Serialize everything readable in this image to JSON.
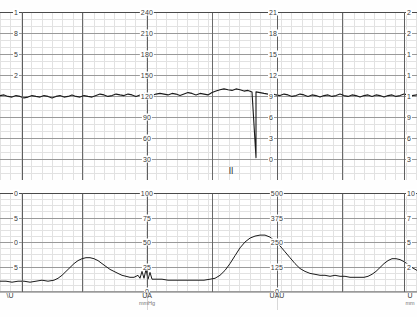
{
  "document": {
    "title": "Cardiotocography Trace Strip",
    "type": "ctg-paper-chart"
  },
  "colors": {
    "trace": "#1b1b1b",
    "grid_minor": "#e2e2e2",
    "grid_major": "#8d8d8d",
    "grid_heavy": "#6a6a6a",
    "paper": "#ffffff",
    "label": "#3a3a3a"
  },
  "fhr_panel": {
    "name": "fetal-heart-rate-panel",
    "scales": [
      {
        "id": "fhr-left-clipped",
        "x": 22,
        "align": "left",
        "clipped": true,
        "ticks": [
          "1",
          "8",
          "5",
          "2",
          "",
          "",
          "",
          ""
        ]
      },
      {
        "id": "fhr-bpm-center",
        "x": 147,
        "align": "center",
        "unit": "bpm",
        "ticks": [
          "240",
          "210",
          "180",
          "150",
          "120",
          "90",
          "60",
          "30"
        ]
      },
      {
        "id": "fhr-kpa-right",
        "x": 277,
        "align": "left",
        "ticks": [
          "21",
          "18",
          "15",
          "12",
          "9",
          "6",
          "3",
          "0"
        ]
      },
      {
        "id": "fhr-right-clipped",
        "x": 404,
        "align": "left",
        "clipped": true,
        "ticks": [
          "2",
          "2",
          "1",
          "1",
          "1",
          "9",
          "6",
          "3"
        ]
      }
    ]
  },
  "toco_panel": {
    "name": "uterine-activity-panel",
    "scales": [
      {
        "id": "toco-left-clipped",
        "x": 22,
        "align": "left",
        "clipped": true,
        "ticks": [
          "0",
          "5",
          "0",
          "5",
          ""
        ]
      },
      {
        "id": "toco-mmhg-center",
        "x": 147,
        "align": "center",
        "unit": "mmHg",
        "ticks": [
          "100",
          "75",
          "50",
          "25",
          "0"
        ]
      },
      {
        "id": "toco-uau-right",
        "x": 277,
        "align": "center",
        "unit": "UAU",
        "ticks": [
          "500",
          "375",
          "250",
          "125",
          "0"
        ]
      },
      {
        "id": "toco-right-clipped",
        "x": 404,
        "align": "left",
        "clipped": true,
        "ticks": [
          "10",
          "7",
          "5",
          "2",
          ""
        ]
      }
    ]
  },
  "footer": {
    "name": "axis-footer",
    "labels": [
      {
        "x": 10,
        "text": "\\U",
        "unit": ""
      },
      {
        "x": 147,
        "text": "UA",
        "unit": "mmHg"
      },
      {
        "x": 277,
        "text": "UAU",
        "unit": ""
      },
      {
        "x": 410,
        "text": "U",
        "unit": "mm"
      }
    ]
  },
  "markers": [
    {
      "name": "event-marker",
      "x": 231,
      "y": 171,
      "glyph": "ӀӀ"
    }
  ],
  "chart_data": [
    {
      "type": "line",
      "name": "fhr-trace",
      "title": "Fetal Heart Rate",
      "ylabel": "bpm",
      "ylim": [
        30,
        255
      ],
      "yticks": [
        30,
        60,
        90,
        120,
        150,
        180,
        210,
        240
      ],
      "grid": true,
      "xlabel": "time",
      "baseline": 145,
      "points": [
        [
          0,
          143
        ],
        [
          4,
          144
        ],
        [
          8,
          142
        ],
        [
          12,
          141
        ],
        [
          16,
          143
        ],
        [
          20,
          142
        ],
        [
          24,
          140
        ],
        [
          28,
          141
        ],
        [
          32,
          143
        ],
        [
          36,
          142
        ],
        [
          40,
          141
        ],
        [
          44,
          143
        ],
        [
          48,
          142
        ],
        [
          52,
          140
        ],
        [
          56,
          142
        ],
        [
          60,
          143
        ],
        [
          64,
          141
        ],
        [
          68,
          142
        ],
        [
          72,
          144
        ],
        [
          76,
          142
        ],
        [
          80,
          141
        ],
        [
          84,
          143
        ],
        [
          88,
          142
        ],
        [
          92,
          141
        ],
        [
          96,
          143
        ],
        [
          100,
          145
        ],
        [
          104,
          144
        ],
        [
          108,
          142
        ],
        [
          112,
          143
        ],
        [
          116,
          145
        ],
        [
          120,
          144
        ],
        [
          124,
          143
        ],
        [
          128,
          145
        ],
        [
          132,
          144
        ],
        [
          136,
          142
        ],
        [
          140,
          144
        ],
        [
          144,
          146
        ],
        [
          148,
          145
        ],
        [
          152,
          143
        ],
        [
          156,
          145
        ],
        [
          160,
          146
        ],
        [
          164,
          145
        ],
        [
          168,
          144
        ],
        [
          172,
          146
        ],
        [
          176,
          145
        ],
        [
          180,
          143
        ],
        [
          184,
          145
        ],
        [
          188,
          147
        ],
        [
          192,
          146
        ],
        [
          196,
          144
        ],
        [
          200,
          146
        ],
        [
          204,
          145
        ],
        [
          208,
          144
        ],
        [
          212,
          147
        ],
        [
          216,
          149
        ],
        [
          220,
          151
        ],
        [
          224,
          152
        ],
        [
          228,
          151
        ],
        [
          232,
          150
        ],
        [
          236,
          152
        ],
        [
          240,
          151
        ],
        [
          244,
          149
        ],
        [
          248,
          150
        ],
        [
          252,
          148
        ],
        [
          256,
          60
        ],
        [
          256,
          148
        ],
        [
          260,
          147
        ],
        [
          264,
          146
        ],
        [
          268,
          145
        ],
        [
          272,
          146
        ],
        [
          276,
          144
        ],
        [
          280,
          143
        ],
        [
          284,
          145
        ],
        [
          288,
          144
        ],
        [
          292,
          142
        ],
        [
          296,
          143
        ],
        [
          300,
          145
        ],
        [
          304,
          144
        ],
        [
          308,
          142
        ],
        [
          312,
          144
        ],
        [
          316,
          143
        ],
        [
          320,
          141
        ],
        [
          324,
          143
        ],
        [
          328,
          144
        ],
        [
          332,
          142
        ],
        [
          336,
          143
        ],
        [
          340,
          145
        ],
        [
          344,
          143
        ],
        [
          348,
          142
        ],
        [
          352,
          144
        ],
        [
          356,
          143
        ],
        [
          360,
          141
        ],
        [
          364,
          143
        ],
        [
          368,
          144
        ],
        [
          372,
          142
        ],
        [
          376,
          144
        ],
        [
          380,
          143
        ],
        [
          384,
          141
        ],
        [
          388,
          143
        ],
        [
          392,
          144
        ],
        [
          396,
          142
        ],
        [
          400,
          143
        ],
        [
          404,
          145
        ],
        [
          408,
          144
        ],
        [
          412,
          143
        ],
        [
          417,
          144
        ]
      ]
    },
    {
      "type": "line",
      "name": "toco-trace",
      "title": "Uterine Activity (TOCO)",
      "ylabel": "mmHg",
      "ylim": [
        0,
        100
      ],
      "yticks": [
        0,
        25,
        50,
        75,
        100
      ],
      "grid": true,
      "xlabel": "time",
      "baseline": 10,
      "contractions": [
        {
          "peak_x": 88,
          "peak_value": 34,
          "onset_x": 55,
          "offset_x": 125
        },
        {
          "peak_x": 262,
          "peak_value": 57,
          "onset_x": 215,
          "offset_x": 300
        },
        {
          "peak_x": 396,
          "peak_value": 33,
          "onset_x": 368,
          "offset_x": 417
        }
      ],
      "points": [
        [
          0,
          10
        ],
        [
          6,
          10
        ],
        [
          12,
          9
        ],
        [
          18,
          10
        ],
        [
          24,
          10
        ],
        [
          30,
          9
        ],
        [
          36,
          10
        ],
        [
          42,
          11
        ],
        [
          48,
          10
        ],
        [
          54,
          11
        ],
        [
          58,
          13
        ],
        [
          62,
          16
        ],
        [
          66,
          20
        ],
        [
          70,
          24
        ],
        [
          74,
          28
        ],
        [
          78,
          31
        ],
        [
          82,
          33
        ],
        [
          86,
          34
        ],
        [
          90,
          34
        ],
        [
          94,
          33
        ],
        [
          98,
          31
        ],
        [
          102,
          28
        ],
        [
          106,
          25
        ],
        [
          110,
          22
        ],
        [
          114,
          20
        ],
        [
          118,
          18
        ],
        [
          122,
          16
        ],
        [
          126,
          15
        ],
        [
          130,
          14
        ],
        [
          134,
          14
        ],
        [
          138,
          16
        ],
        [
          140,
          13
        ],
        [
          142,
          20
        ],
        [
          144,
          13
        ],
        [
          146,
          22
        ],
        [
          148,
          12
        ],
        [
          150,
          19
        ],
        [
          152,
          12
        ],
        [
          156,
          12
        ],
        [
          162,
          12
        ],
        [
          168,
          11
        ],
        [
          174,
          11
        ],
        [
          180,
          11
        ],
        [
          186,
          11
        ],
        [
          192,
          11
        ],
        [
          198,
          11
        ],
        [
          204,
          11
        ],
        [
          210,
          12
        ],
        [
          215,
          13
        ],
        [
          220,
          16
        ],
        [
          225,
          21
        ],
        [
          230,
          28
        ],
        [
          235,
          36
        ],
        [
          240,
          44
        ],
        [
          245,
          50
        ],
        [
          250,
          54
        ],
        [
          255,
          56
        ],
        [
          260,
          57
        ],
        [
          265,
          57
        ],
        [
          270,
          55
        ],
        [
          275,
          51
        ],
        [
          280,
          46
        ],
        [
          285,
          40
        ],
        [
          290,
          34
        ],
        [
          295,
          28
        ],
        [
          300,
          23
        ],
        [
          305,
          20
        ],
        [
          310,
          18
        ],
        [
          315,
          17
        ],
        [
          320,
          16
        ],
        [
          325,
          16
        ],
        [
          330,
          15
        ],
        [
          335,
          16
        ],
        [
          340,
          15
        ],
        [
          345,
          15
        ],
        [
          350,
          14
        ],
        [
          355,
          14
        ],
        [
          360,
          14
        ],
        [
          364,
          14
        ],
        [
          368,
          15
        ],
        [
          372,
          17
        ],
        [
          376,
          20
        ],
        [
          380,
          24
        ],
        [
          384,
          28
        ],
        [
          388,
          31
        ],
        [
          392,
          33
        ],
        [
          396,
          33
        ],
        [
          400,
          32
        ],
        [
          404,
          30
        ],
        [
          408,
          27
        ],
        [
          412,
          24
        ],
        [
          417,
          21
        ]
      ]
    }
  ]
}
